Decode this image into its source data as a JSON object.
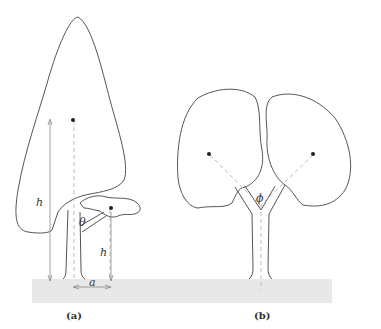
{
  "figure": {
    "panels": [
      {
        "id": "a",
        "caption": "(a)",
        "labels": {
          "height_tall": "h",
          "angle": "θ",
          "height_short": "h",
          "distance": "a"
        }
      },
      {
        "id": "b",
        "caption": "(b)",
        "labels": {
          "angle": "ϕ"
        }
      }
    ],
    "colors": {
      "outline": "#555555",
      "ground": "#e8e8e8",
      "dashed": "#bbbbbb",
      "dot": "#222222"
    }
  }
}
